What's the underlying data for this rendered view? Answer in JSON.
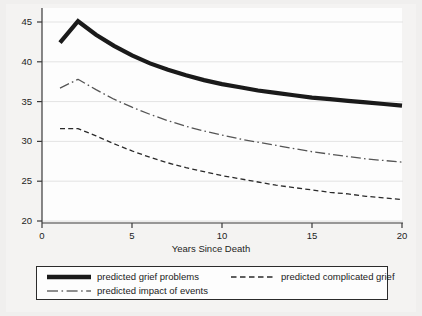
{
  "chart_data": {
    "type": "line",
    "title": "",
    "xlabel": "Years Since Death",
    "ylabel": "",
    "xlim": [
      0,
      20
    ],
    "ylim": [
      20,
      45
    ],
    "grid": true,
    "grid_orientation": "horizontal",
    "legend_position": "bottom",
    "xticks": [
      "0",
      "5",
      "10",
      "15",
      "20"
    ],
    "xtick_values": [
      0,
      5,
      10,
      15,
      20
    ],
    "yticks": [
      "20",
      "25",
      "30",
      "35",
      "40",
      "45"
    ],
    "ytick_values": [
      20,
      25,
      30,
      35,
      40,
      45
    ],
    "x": [
      1,
      2,
      3,
      4,
      5,
      6,
      7,
      8,
      9,
      10,
      11,
      12,
      13,
      14,
      15,
      16,
      17,
      18,
      19,
      20
    ],
    "series": [
      {
        "name": "predicted grief problems",
        "style": "solid-thick",
        "color": "#1a1a1a",
        "width": 4.2,
        "values": [
          42.4,
          45.1,
          43.4,
          42.0,
          40.8,
          39.8,
          39.0,
          38.3,
          37.7,
          37.2,
          36.8,
          36.4,
          36.1,
          35.8,
          35.5,
          35.3,
          35.1,
          34.9,
          34.7,
          34.5
        ]
      },
      {
        "name": "predicted complicated grief",
        "style": "dashed",
        "color": "#2a2a2a",
        "width": 1.3,
        "values": [
          31.6,
          31.6,
          30.7,
          29.7,
          28.8,
          28.0,
          27.3,
          26.7,
          26.2,
          25.7,
          25.3,
          24.9,
          24.5,
          24.2,
          23.9,
          23.6,
          23.4,
          23.1,
          22.9,
          22.7
        ]
      },
      {
        "name": "predicted impact of events",
        "style": "dash-dot",
        "color": "#555555",
        "width": 1.3,
        "values": [
          36.7,
          37.8,
          36.5,
          35.3,
          34.3,
          33.4,
          32.6,
          31.9,
          31.3,
          30.8,
          30.3,
          29.9,
          29.5,
          29.1,
          28.7,
          28.4,
          28.1,
          27.8,
          27.6,
          27.4
        ]
      }
    ]
  },
  "legend": {
    "entries": [
      {
        "label": "predicted grief problems",
        "key": "solid-thick-line-swatch"
      },
      {
        "label": "predicted complicated grief",
        "key": "dashed-line-swatch"
      },
      {
        "label": "predicted impact of events",
        "key": "dash-dot-line-swatch"
      }
    ]
  }
}
